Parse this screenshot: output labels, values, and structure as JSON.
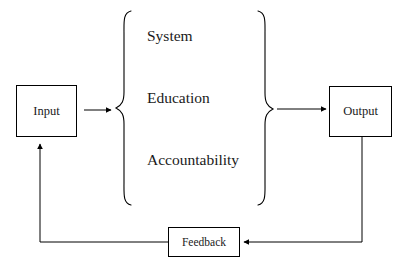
{
  "diagram": {
    "background_color": "#ffffff",
    "line_color": "#000000",
    "text_color": "#1a1a1a",
    "nodes": {
      "input": {
        "label": "Input"
      },
      "output": {
        "label": "Output"
      },
      "feedback": {
        "label": "Feedback"
      }
    },
    "process_group": {
      "items": [
        {
          "label": "System"
        },
        {
          "label": "Education"
        },
        {
          "label": "Accountability"
        }
      ],
      "left_brace": "{",
      "right_brace": "}"
    },
    "connectors": [
      {
        "name": "input-to-process",
        "from": "Input",
        "to": "Process group",
        "style": "arrow-right"
      },
      {
        "name": "process-to-output",
        "from": "Process group",
        "to": "Output",
        "style": "arrow-right"
      },
      {
        "name": "output-to-feedback",
        "from": "Output",
        "to": "Feedback",
        "style": "arrow-left-elbow"
      },
      {
        "name": "feedback-to-input",
        "from": "Feedback",
        "to": "Input",
        "style": "arrow-up-elbow"
      }
    ]
  }
}
